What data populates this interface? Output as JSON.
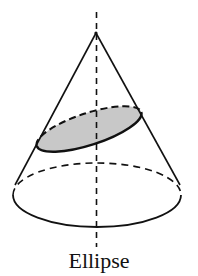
{
  "figure": {
    "caption": "Ellipse",
    "colors": {
      "stroke": "#111111",
      "section_fill": "#c8c8c8",
      "background": "#ffffff"
    },
    "elements": [
      {
        "name": "cone-axis",
        "style": "dashed",
        "desc": "vertical axis of cone"
      },
      {
        "name": "cone-apex",
        "desc": "apex of cone"
      },
      {
        "name": "cone-sides",
        "style": "solid",
        "desc": "two generator lines"
      },
      {
        "name": "base-ellipse",
        "desc": "base circle; back half dashed, front half solid"
      },
      {
        "name": "section-ellipse",
        "desc": "tilted shaded elliptical cross-section; back half dashed, front half solid"
      }
    ]
  }
}
